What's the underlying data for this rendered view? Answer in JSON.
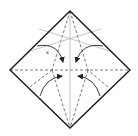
{
  "diagram": {
    "type": "origami-fold-diagram",
    "colors": {
      "outline": "#1a1a1a",
      "valley": "#555555",
      "crease": "#b8b8b8",
      "arrow": "#222222",
      "background": "#ffffff"
    },
    "square": {
      "top": [
        70,
        11
      ],
      "right": [
        130,
        70
      ],
      "bottom": [
        70,
        128
      ],
      "left": [
        10,
        70
      ]
    },
    "lines": [
      {
        "kind": "crease",
        "from": [
          70,
          11
        ],
        "to": [
          70,
          128
        ]
      },
      {
        "kind": "valley",
        "from": [
          10,
          70
        ],
        "to": [
          130,
          70
        ]
      },
      {
        "kind": "valley",
        "from": [
          70,
          11
        ],
        "to": [
          52,
          70
        ]
      },
      {
        "kind": "valley",
        "from": [
          52,
          70
        ],
        "to": [
          70,
          128
        ]
      },
      {
        "kind": "valley",
        "from": [
          70,
          11
        ],
        "to": [
          88,
          70
        ]
      },
      {
        "kind": "valley",
        "from": [
          88,
          70
        ],
        "to": [
          70,
          128
        ]
      },
      {
        "kind": "crease",
        "from": [
          27,
          52
        ],
        "to": [
          101,
          29
        ]
      },
      {
        "kind": "crease",
        "from": [
          39,
          29
        ],
        "to": [
          113,
          52
        ]
      },
      {
        "kind": "valley",
        "from": [
          30,
          87
        ],
        "to": [
          52,
          70
        ]
      },
      {
        "kind": "valley",
        "from": [
          108,
          87
        ],
        "to": [
          88,
          70
        ]
      }
    ],
    "arrows": [
      {
        "name": "upper-left-arrow",
        "path": "M37,46 Q58,42 63,62"
      },
      {
        "name": "upper-right-arrow",
        "path": "M103,46 Q82,42 76,62"
      },
      {
        "name": "lower-left-arrow",
        "path": "M40,96 Q45,78 62,76"
      },
      {
        "name": "lower-right-arrow",
        "path": "M100,96 Q95,78 78,76"
      }
    ],
    "label": {
      "text": "x",
      "x": 46,
      "y": 54
    }
  }
}
